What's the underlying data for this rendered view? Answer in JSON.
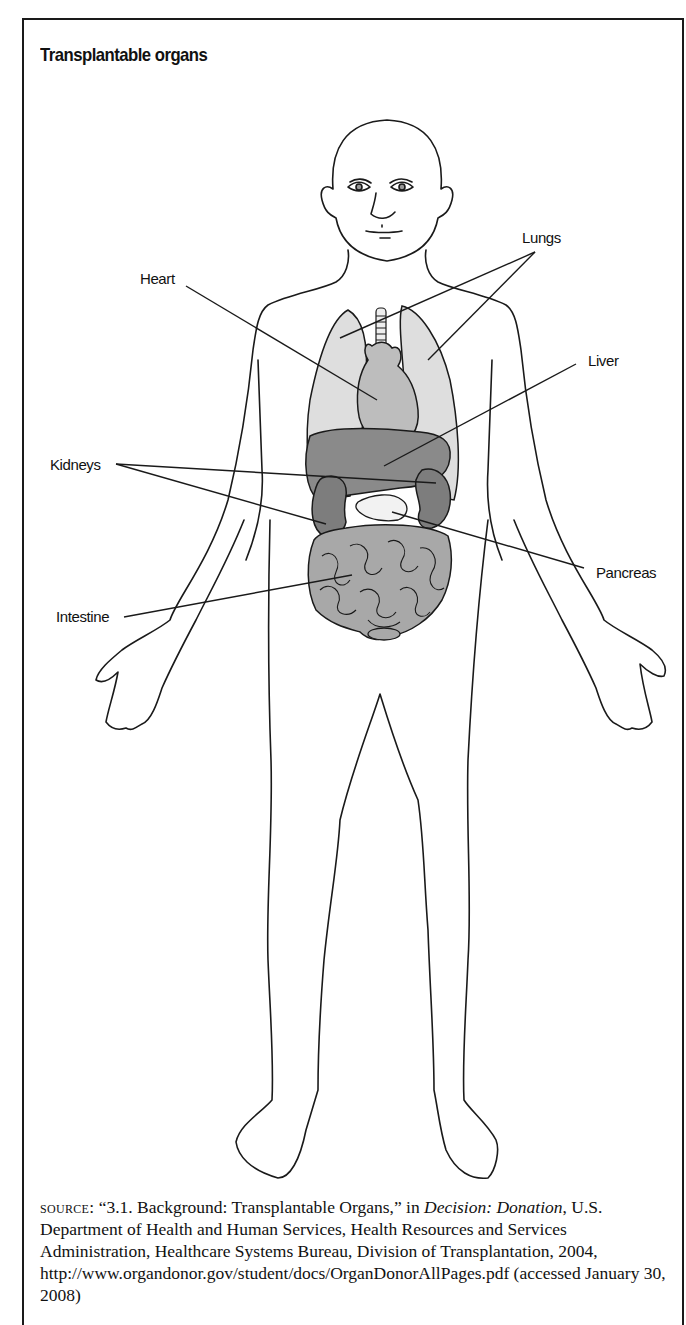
{
  "figure": {
    "title": "Transplantable organs",
    "labels": {
      "lungs": "Lungs",
      "heart": "Heart",
      "liver": "Liver",
      "kidneys": "Kidneys",
      "pancreas": "Pancreas",
      "intestine": "Intestine"
    },
    "colors": {
      "outline": "#1a1a1a",
      "lungs_fill": "#dedede",
      "heart_fill": "#bdbdbd",
      "liver_fill": "#8a8a8a",
      "kidney_fill": "#7d7d7d",
      "intestine_fill": "#a8a8a8",
      "pancreas_fill": "#f2f2f2"
    }
  },
  "source": {
    "prefix": "source:",
    "quote": "“3.1. Background: Transplantable Organs,” in ",
    "publication": "Decision: Donation",
    "rest": ", U.S. Department of Health and Human Services, Health Resources and Services Administration, Healthcare Systems Bureau, Division of Transplantation, 2004, http://www.organdonor.gov/student/docs/OrganDonorAllPages.pdf (accessed January 30, 2008)"
  }
}
